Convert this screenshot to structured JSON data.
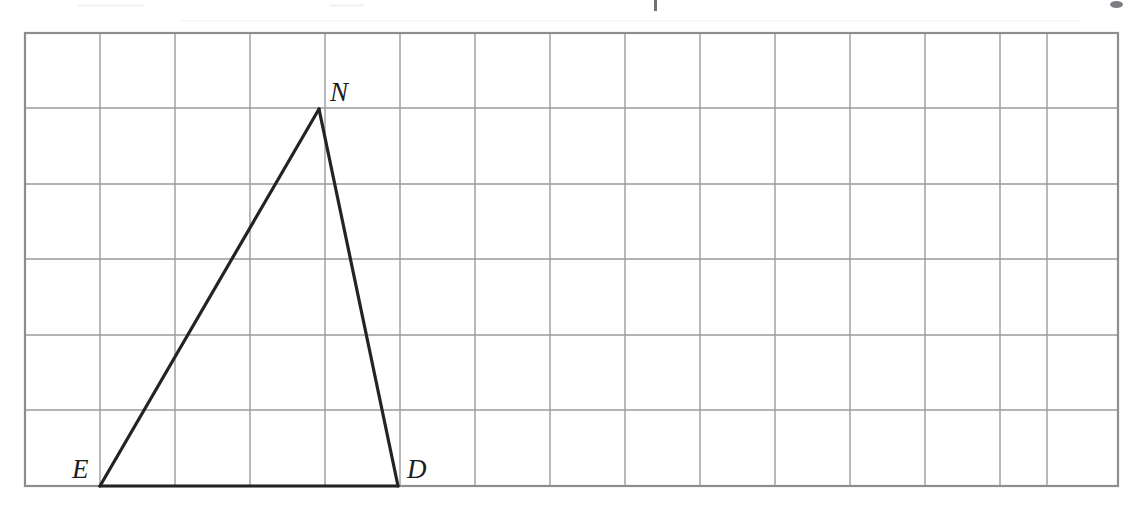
{
  "figure": {
    "name": "triangle-on-grid-figure",
    "background_color": "#ffffff",
    "grid": {
      "line_color": "#9a9a9a",
      "border_color": "#8d8d8d",
      "cell_size": 75,
      "left": 25,
      "top": 33,
      "right": 1118,
      "bottom": 486,
      "columns": 15,
      "rows": 6,
      "x_lines": [
        25,
        100,
        175,
        250,
        325,
        400,
        475,
        550,
        625,
        700,
        775,
        850,
        925,
        1000,
        1047,
        1118
      ],
      "y_lines": [
        33,
        108,
        184,
        259,
        335,
        410,
        486
      ]
    },
    "shape": {
      "type": "triangle",
      "name": "END",
      "stroke_color": "#232323",
      "stroke_width": 3.2,
      "fill": "none",
      "vertices": [
        {
          "label": "E",
          "x": 100,
          "y": 486,
          "label_x": 72,
          "label_y": 478
        },
        {
          "label": "N",
          "x": 319,
          "y": 109,
          "label_x": 330,
          "label_y": 101
        },
        {
          "label": "D",
          "x": 398,
          "y": 486,
          "label_x": 407,
          "label_y": 478
        }
      ],
      "edges": [
        {
          "name": "edge-EN",
          "from": "E",
          "to": "N"
        },
        {
          "name": "edge-ND",
          "from": "N",
          "to": "D"
        },
        {
          "name": "edge-DE",
          "from": "D",
          "to": "E"
        }
      ]
    },
    "artifacts": {
      "top_text_remnant": "",
      "note": "faint cut-off scan remnants along the very top edge"
    }
  }
}
